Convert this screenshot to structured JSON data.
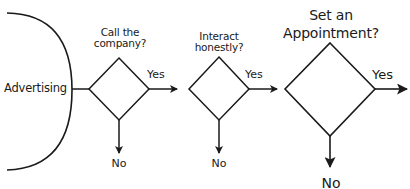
{
  "diagram": {
    "start": {
      "label": "Advertising"
    },
    "decisions": [
      {
        "question_line1": "Call the",
        "question_line2": "company?",
        "yes_label": "Yes",
        "no_label": "No"
      },
      {
        "question_line1": "Interact",
        "question_line2": "honestly?",
        "yes_label": "Yes",
        "no_label": "No"
      },
      {
        "question_line1": "Set an",
        "question_line2": "Appointment?",
        "yes_label": "Yes",
        "no_label": "No"
      }
    ],
    "colors": {
      "stroke": "#1a1a1a",
      "background": "#ffffff"
    }
  }
}
